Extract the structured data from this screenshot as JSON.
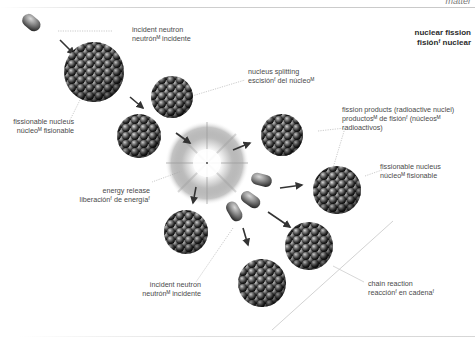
{
  "header": {
    "section": "matter",
    "title_en": "nuclear fission",
    "title_es": "fisiónᶠ nuclear"
  },
  "labels": {
    "incident_neutron_top": {
      "en": "incident neutron",
      "es": "neutrónᴹ incidente"
    },
    "fissionable_nucleus_left": {
      "en": "fissionable nucleus",
      "es": "núcleoᴹ fisionable"
    },
    "nucleus_splitting": {
      "en": "nucleus splitting",
      "es": "escisiónᶠ del núcleoᴹ"
    },
    "fission_products": {
      "en": "fission products (radioactive nuclei)",
      "es1": "productosᴹ de fisiónᶠ (núcleosᴹ",
      "es2": "radioactivos)"
    },
    "energy_release": {
      "en": "energy release",
      "es": "liberaciónᶠ de energíaᶠ"
    },
    "fissionable_nucleus_right": {
      "en": "fissionable nucleus",
      "es": "núcleoᴹ fisionable"
    },
    "incident_neutron_bottom": {
      "en": "incident neutron",
      "es": "neutrónᴹ incidente"
    },
    "chain_reaction": {
      "en": "chain reaction",
      "es": "reacciónᶠ en cadenaᶠ"
    }
  },
  "colors": {
    "nucleus_dark": "#1e1e1e",
    "nucleus_mid": "#555555",
    "nucleus_light": "#bdbdbd",
    "arrow": "#333333",
    "leader_line": "#b5b5b5",
    "text": "#4a4a4a"
  }
}
